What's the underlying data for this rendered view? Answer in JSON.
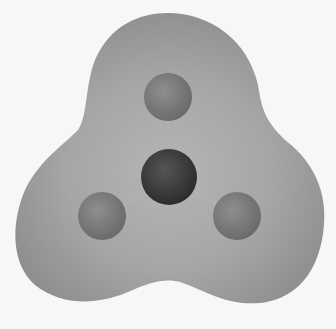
{
  "figure": {
    "description": "Electrostatic potential surface with ball-and-stick molecule (trigonal planar, central atom with three substituents)",
    "colors": {
      "background": "#f7f7f7",
      "surface": "#9a9a9a",
      "surface_highlight": "#b8b8b8",
      "central_atom": "#3a3a3a",
      "outer_atom": "#7a7a7a",
      "bond": "#b0b0b0"
    },
    "atoms": [
      {
        "role": "central",
        "cx": 169,
        "cy": 177,
        "r": 28
      },
      {
        "role": "outer-top",
        "cx": 168,
        "cy": 97,
        "r": 24
      },
      {
        "role": "outer-left",
        "cx": 102,
        "cy": 216,
        "r": 24
      },
      {
        "role": "outer-right",
        "cx": 237,
        "cy": 216,
        "r": 24
      }
    ]
  }
}
